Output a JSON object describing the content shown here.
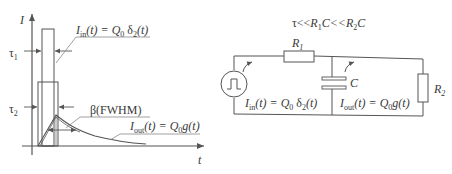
{
  "left_plot": {
    "y_axis_label": "I",
    "x_axis_label": "t",
    "tau1_label": "τ",
    "tau1_sub": "1",
    "tau2_label": "τ",
    "tau2_sub": "2",
    "input_pulse_label": {
      "I": "I",
      "sub": "in",
      "rest": "(t) = Q",
      "q_sub": "0",
      "delta": " δ",
      "delta_sub": "2",
      "tail": "(t)"
    },
    "fwhm_label": "β(FWHM)",
    "output_label": {
      "I": "I",
      "sub": "out",
      "rest": "(t) = Q",
      "q_sub": "0",
      "tail": "g(t)"
    }
  },
  "circuit": {
    "condition": {
      "tau": "τ<<",
      "R1": "R",
      "R1_sub": "1",
      "C1": "C<<",
      "R2": "R",
      "R2_sub": "2",
      "C2": "C"
    },
    "r1_label": "R",
    "r1_sub": "1",
    "r2_label": "R",
    "r2_sub": "2",
    "c_label": "C",
    "source_symbol": "pulse-source",
    "input_current": {
      "I": "I",
      "sub": "in",
      "rest": "(t) = Q",
      "q_sub": "0",
      "delta": " δ",
      "delta_sub": "2",
      "tail": "(t)"
    },
    "output_current": {
      "I": "I",
      "sub": "out",
      "rest": "(t) = Q",
      "q_sub": "0",
      "tail": "g(t)"
    }
  },
  "colors": {
    "line": "#555555",
    "light_line": "#888888",
    "text": "#3a3a3a",
    "background": "#ffffff"
  }
}
